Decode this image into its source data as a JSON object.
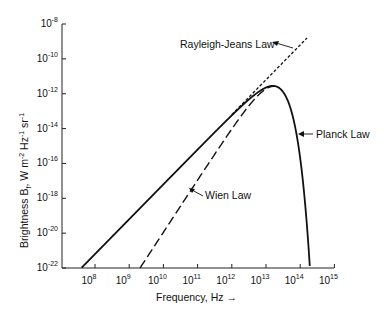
{
  "chart_data": {
    "type": "line",
    "title": "",
    "xlabel": "Frequency, Hz →",
    "ylabel": "Brightness B_f, W m^-2 Hz^-1 sr^-1",
    "xscale": "log",
    "yscale": "log",
    "xlim": [
      10000000.0,
      1000000000000000.0
    ],
    "ylim": [
      1e-22,
      1e-08
    ],
    "x_ticks": [
      {
        "base": "10",
        "exp": "8"
      },
      {
        "base": "10",
        "exp": "9"
      },
      {
        "base": "10",
        "exp": "10"
      },
      {
        "base": "10",
        "exp": "11"
      },
      {
        "base": "10",
        "exp": "12"
      },
      {
        "base": "10",
        "exp": "13"
      },
      {
        "base": "10",
        "exp": "14"
      },
      {
        "base": "10",
        "exp": "15"
      }
    ],
    "y_ticks": [
      {
        "base": "10",
        "exp": "-8"
      },
      {
        "base": "10",
        "exp": "-10"
      },
      {
        "base": "10",
        "exp": "-12"
      },
      {
        "base": "10",
        "exp": "-14"
      },
      {
        "base": "10",
        "exp": "-16"
      },
      {
        "base": "10",
        "exp": "-18"
      },
      {
        "base": "10",
        "exp": "-20"
      },
      {
        "base": "10",
        "exp": "-22"
      }
    ],
    "grid": false,
    "legend": "none (inline annotations)",
    "series": [
      {
        "name": "Planck Law",
        "style": "solid",
        "log_x": [
          7.6,
          8,
          9,
          10,
          11,
          12,
          12.5,
          13,
          13.2,
          13.5,
          13.8,
          14,
          14.2,
          14.28
        ],
        "log_y": [
          -22.0,
          -21.2,
          -19.2,
          -17.2,
          -15.2,
          -13.3,
          -12.4,
          -11.7,
          -11.55,
          -11.6,
          -12.4,
          -13.9,
          -17.3,
          -22.0
        ]
      },
      {
        "name": "Rayleigh-Jeans Law",
        "style": "dashed-short",
        "log_x": [
          7.6,
          9,
          11,
          13,
          14.2
        ],
        "log_y": [
          -22.0,
          -19.2,
          -15.2,
          -11.2,
          -8.8
        ]
      },
      {
        "name": "Wien Law",
        "style": "dashed-long",
        "log_x": [
          9.4,
          10,
          11,
          12,
          13,
          13.2
        ],
        "log_y": [
          -22.0,
          -20.0,
          -17.0,
          -14.0,
          -11.9,
          -11.6
        ]
      }
    ],
    "annotations": [
      {
        "text": "Rayleigh-Jeans Law",
        "points_to": "Rayleigh-Jeans Law"
      },
      {
        "text": "Planck Law",
        "points_to": "Planck Law"
      },
      {
        "text": "Wien Law",
        "points_to": "Wien Law"
      }
    ]
  },
  "labels": {
    "rj": "Rayleigh-Jeans Law",
    "planck": "Planck Law",
    "wien": "Wien Law",
    "xlabel": "Frequency, Hz →",
    "ylabel_main": "Brightness B",
    "ylabel_sub": "f",
    "ylabel_rest": ", W m",
    "ylabel_e1": "-2",
    "ylabel_hz": " Hz",
    "ylabel_e2": "-1",
    "ylabel_sr": " sr",
    "ylabel_e3": "-1"
  }
}
